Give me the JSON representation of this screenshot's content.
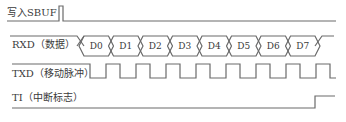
{
  "signals": [
    {
      "id": "write-sbuf",
      "label": "写入SBUF"
    },
    {
      "id": "rxd",
      "label": "RXD（数据）"
    },
    {
      "id": "txd",
      "label": "TXD（移动脉冲）"
    },
    {
      "id": "ti",
      "label": "TI（中断标志）"
    }
  ],
  "data_bits": [
    "D0",
    "D1",
    "D2",
    "D3",
    "D4",
    "D5",
    "D6",
    "D7"
  ],
  "colors": {
    "line": "#6a6a6a",
    "text": "#3a3a3a",
    "background": "#ffffff"
  }
}
